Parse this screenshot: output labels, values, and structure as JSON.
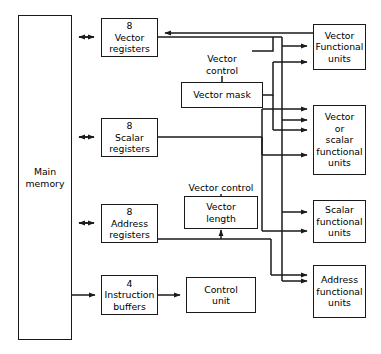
{
  "diagram": {
    "type": "block-diagram",
    "blocks": {
      "main_memory": "Main\nmemory",
      "vector_registers": "8\nVector\nregisters",
      "scalar_registers": "8\nScalar\nregisters",
      "address_registers": "8\nAddress\nregisters",
      "instruction_buffers": "4\nInstruction\nbuffers",
      "vector_mask": "Vector mask",
      "vector_length": "Vector\nlength",
      "control_unit": "Control\nunit",
      "vector_functional_units": "Vector\nFunctional\nunits",
      "vector_or_scalar_functional_units": "Vector\nor\nscalar\nfunctional\nunits",
      "scalar_functional_units": "Scalar\nfunctional\nunits",
      "address_functional_units": "Address\nfunctional\nunits"
    },
    "labels": {
      "vector_control_mask": "Vector\ncontrol",
      "vector_control_length": "Vector control"
    },
    "colors": {
      "stroke": "#1a1a1a",
      "background": "#ffffff",
      "text": "#000000"
    }
  }
}
